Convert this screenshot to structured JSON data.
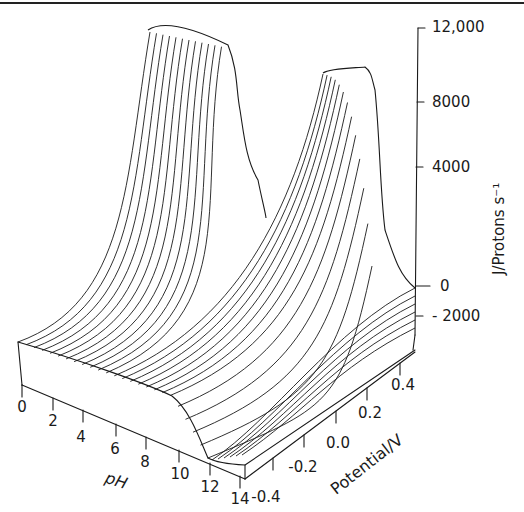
{
  "chart_data": {
    "type": "surface3d",
    "title": "",
    "xlabel": "pH",
    "ylabel": "Potential/V",
    "zlabel": "J/Protons s⁻¹",
    "x_ticks": [
      "0",
      "2",
      "4",
      "6",
      "8",
      "10",
      "12",
      "14"
    ],
    "y_ticks": [
      "-0.4",
      "-0.2",
      "0.0",
      "0.2",
      "0.4"
    ],
    "z_ticks": [
      "12,000",
      "8000",
      "4000",
      "0",
      "-2000"
    ],
    "xlim": [
      0,
      14
    ],
    "ylim": [
      -0.4,
      0.5
    ],
    "zlim": [
      -2000,
      12000
    ],
    "grid": false,
    "style": "wireframe lines of constant pH (line drawing, black on white)",
    "features": [
      {
        "name": "peak-1",
        "description": "tall ridge at low potential, high pH region",
        "approx_peak_J": 12000
      },
      {
        "name": "peak-2",
        "description": "second ridge at high potential",
        "approx_peak_J": 10500
      },
      {
        "name": "plateau",
        "description": "flat region at low pH, J near 0"
      }
    ]
  },
  "labels": {
    "z_axis_title": "J/Protons s⁻¹",
    "x_axis_title": "pH",
    "y_axis_title": "Potential/V",
    "z_ticks": [
      "12,000",
      "8000",
      "4000",
      "0",
      "- 2000"
    ],
    "x_ticks": [
      "0",
      "2",
      "4",
      "6",
      "8",
      "10",
      "12",
      "14"
    ],
    "y_ticks": [
      "-0.4",
      "-0.2",
      "0.0",
      "0.2",
      "0.4"
    ]
  }
}
